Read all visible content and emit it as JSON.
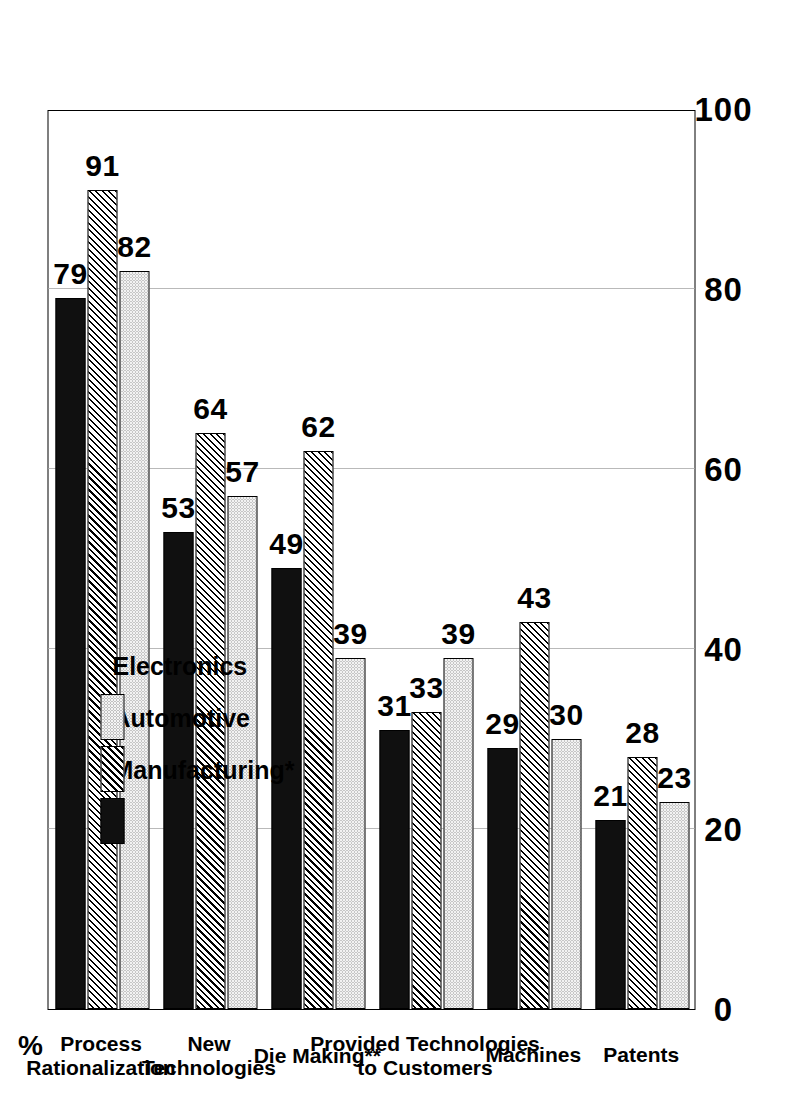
{
  "chart_data": {
    "type": "bar",
    "orientation": "horizontal",
    "title": "",
    "xlabel": "",
    "ylabel": "%",
    "unit_label": "%",
    "xlim": [
      0,
      100
    ],
    "ticks": [
      "0",
      "20",
      "40",
      "60",
      "80",
      "100"
    ],
    "grid": true,
    "legend_position": "top-left-inside",
    "categories": [
      "Process\nRationalization",
      "New\nTechnologies",
      "Die Making**",
      "Provided Technologies\nto Customers",
      "Machines",
      "Patents"
    ],
    "category_labels": [
      {
        "line1": "Process",
        "line2": "Rationalization"
      },
      {
        "line1": "New",
        "line2": "Technologies"
      },
      {
        "line1": "Die Making**",
        "line2": ""
      },
      {
        "line1": "Provided Technologies",
        "line2": "to Customers"
      },
      {
        "line1": "Machines",
        "line2": ""
      },
      {
        "line1": "Patents",
        "line2": ""
      }
    ],
    "series": [
      {
        "name": "Manufacturing*",
        "pattern": "solid-black",
        "values": [
          79,
          53,
          49,
          31,
          29,
          21
        ]
      },
      {
        "name": "Automotive",
        "pattern": "diagonal-hatch",
        "values": [
          91,
          64,
          62,
          33,
          43,
          28
        ]
      },
      {
        "name": "Electronics",
        "pattern": "light-dotted",
        "values": [
          82,
          57,
          39,
          39,
          30,
          23
        ]
      }
    ]
  },
  "legend": {
    "items": [
      {
        "label": "Manufacturing*",
        "swatch": "solid-black"
      },
      {
        "label": "Automotive",
        "swatch": "diagonal-hatch"
      },
      {
        "label": "Electronics",
        "swatch": "light-dotted"
      }
    ]
  },
  "axis": {
    "unit": "%",
    "ticks": [
      "100",
      "80",
      "60",
      "40",
      "20",
      "0"
    ]
  },
  "colors": {
    "series_manufacturing": "#101010",
    "series_automotive": "#d8d8d8",
    "series_electronics": "#f2f2f2",
    "gridline": "#b9b9b9",
    "frame": "#000000",
    "background": "#ffffff"
  }
}
